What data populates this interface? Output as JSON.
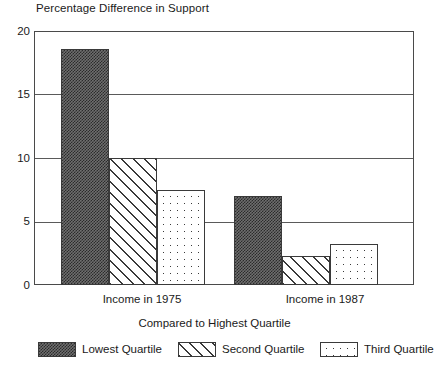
{
  "chart_data": {
    "type": "bar",
    "title": "Percentage Difference in Support",
    "xlabel": "Compared to Highest Quartile",
    "ylabel": "",
    "categories": [
      "Income in 1975",
      "Income in 1987"
    ],
    "series": [
      {
        "name": "Lowest Quartile",
        "pattern": "dark-checker",
        "values": [
          18.6,
          7.0
        ]
      },
      {
        "name": "Second Quartile",
        "pattern": "diagonal-hatch",
        "values": [
          10.0,
          2.3
        ]
      },
      {
        "name": "Third Quartile",
        "pattern": "sparse-dots",
        "values": [
          7.5,
          3.2
        ]
      }
    ],
    "ylim": [
      0,
      20
    ],
    "yticks": [
      0,
      5,
      10,
      15,
      20
    ],
    "ytick_labels": [
      "0",
      "5",
      "10",
      "15",
      "20"
    ],
    "grid": true,
    "legend_position": "bottom",
    "colors": {
      "axis": "#4a4a4a",
      "grid": "#5a5a5a",
      "bar_outline": "#3a3a3a",
      "text": "#1a1a1a",
      "background": "#ffffff"
    }
  },
  "axis": {
    "y_labels": [
      "20",
      "15",
      "10",
      "5",
      "0"
    ]
  },
  "legend": {
    "items": [
      {
        "label": "Lowest Quartile"
      },
      {
        "label": "Second Quartile"
      },
      {
        "label": "Third Quartile"
      }
    ]
  }
}
